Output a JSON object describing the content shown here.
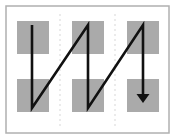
{
  "figure": {
    "canvas": {
      "width": 175,
      "height": 139
    },
    "colors": {
      "background": "#ffffff",
      "frame_border": "#b0b0b0",
      "cell_fill": "#aaaaaa",
      "path_stroke": "#111111",
      "guide_dashed": "#d7d7d7"
    },
    "frame": {
      "x": 6,
      "y": 6,
      "width": 163,
      "height": 127,
      "stroke_width": 1.5
    },
    "cells": [
      {
        "id": "cell-r1c1",
        "row": 1,
        "col": 1,
        "x": 17,
        "y": 21,
        "width": 32,
        "height": 33
      },
      {
        "id": "cell-r1c2",
        "row": 1,
        "col": 2,
        "x": 72,
        "y": 21,
        "width": 32,
        "height": 33
      },
      {
        "id": "cell-r1c3",
        "row": 1,
        "col": 3,
        "x": 127,
        "y": 21,
        "width": 32,
        "height": 33
      },
      {
        "id": "cell-r2c1",
        "row": 2,
        "col": 1,
        "x": 17,
        "y": 79,
        "width": 32,
        "height": 33
      },
      {
        "id": "cell-r2c2",
        "row": 2,
        "col": 2,
        "x": 72,
        "y": 79,
        "width": 32,
        "height": 33
      },
      {
        "id": "cell-r2c3",
        "row": 2,
        "col": 3,
        "x": 127,
        "y": 79,
        "width": 32,
        "height": 33
      }
    ],
    "guides": [
      {
        "id": "guide-1",
        "x": 60,
        "y1": 14,
        "y2": 126,
        "dash": "2 3"
      },
      {
        "id": "guide-2",
        "x": 115,
        "y1": 14,
        "y2": 126,
        "dash": "2 3"
      }
    ],
    "path": {
      "id": "zigzag-scan-path",
      "stroke_width": 2.6,
      "points": [
        {
          "x": 32,
          "y": 25
        },
        {
          "x": 32,
          "y": 108
        },
        {
          "x": 88,
          "y": 25
        },
        {
          "x": 88,
          "y": 108
        },
        {
          "x": 143,
          "y": 25
        },
        {
          "x": 143,
          "y": 97
        }
      ]
    },
    "arrow": {
      "id": "path-end-arrowhead",
      "tip_x": 143,
      "tip_y": 103,
      "half_width": 6.5,
      "length": 9,
      "direction": "down"
    },
    "counts": {
      "cells": 6,
      "columns": 3,
      "rows": 2,
      "guides": 2,
      "path_segments": 5
    },
    "labels": {
      "alt": "Diagram: black zigzag sawtooth line sweeping down-up-down across three columns of gray square cells, terminating in a downward arrow in the lower-right cell."
    }
  }
}
